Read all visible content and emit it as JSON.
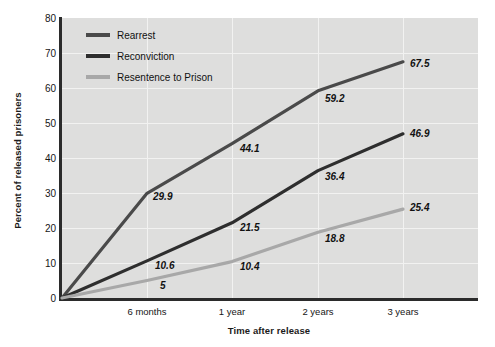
{
  "chart_data": {
    "type": "line",
    "title": "",
    "xlabel": "Time after release",
    "ylabel": "Percent of released prisoners",
    "categories": [
      "release",
      "6 months",
      "1 year",
      "2 years",
      "3 years"
    ],
    "tick_labels": [
      "6 months",
      "1 year",
      "2 years",
      "3 years"
    ],
    "x": [
      0,
      0.5,
      1,
      2,
      3
    ],
    "ylim": [
      0,
      80
    ],
    "yticks": [
      0,
      10,
      20,
      30,
      40,
      50,
      60,
      70,
      80
    ],
    "grid": "both",
    "legend_position": "top-left",
    "series": [
      {
        "name": "Rearrest",
        "color": "#4a4a4a",
        "values": [
          0,
          29.9,
          44.1,
          59.2,
          67.5
        ],
        "labels": [
          "",
          "29.9",
          "44.1",
          "59.2",
          "67.5"
        ]
      },
      {
        "name": "Reconviction",
        "color": "#2e2e2e",
        "values": [
          0,
          10.6,
          21.5,
          36.4,
          46.9
        ],
        "labels": [
          "",
          "10.6",
          "21.5",
          "36.4",
          "46.9"
        ]
      },
      {
        "name": "Resentence to Prison",
        "color": "#a8a8a8",
        "values": [
          0,
          5,
          10.4,
          18.8,
          25.4
        ],
        "labels": [
          "",
          "5",
          "10.4",
          "18.8",
          "25.4"
        ]
      }
    ]
  },
  "axes": {
    "y_title": "Percent of released prisoners",
    "x_title": "Time after release",
    "y_tick_0": "0",
    "y_tick_10": "10",
    "y_tick_20": "20",
    "y_tick_30": "30",
    "y_tick_40": "40",
    "y_tick_50": "50",
    "y_tick_60": "60",
    "y_tick_70": "70",
    "y_tick_80": "80",
    "x_tick_1": "6 months",
    "x_tick_2": "1 year",
    "x_tick_3": "2 years",
    "x_tick_4": "3 years"
  },
  "legend": {
    "items": [
      {
        "label": "Rearrest",
        "color": "#4a4a4a"
      },
      {
        "label": "Reconviction",
        "color": "#2e2e2e"
      },
      {
        "label": "Resentence to Prison",
        "color": "#a8a8a8"
      }
    ]
  },
  "point_labels": {
    "rearrest_6mo": "29.9",
    "rearrest_1yr": "44.1",
    "rearrest_2yr": "59.2",
    "rearrest_3yr": "67.5",
    "reconviction_6mo": "10.6",
    "reconviction_1yr": "21.5",
    "reconviction_2yr": "36.4",
    "reconviction_3yr": "46.9",
    "resentence_6mo": "5",
    "resentence_1yr": "10.4",
    "resentence_2yr": "18.8",
    "resentence_3yr": "25.4"
  },
  "colors": {
    "plot_background": "#dededd",
    "page_background": "#ffffff",
    "gridline": "#f2f2f1",
    "axis": "#2b2b2b",
    "rearrest": "#4a4a4a",
    "reconviction": "#2e2e2e",
    "resentence": "#a8a8a8"
  }
}
